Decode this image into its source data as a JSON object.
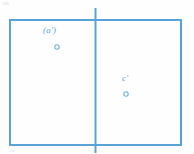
{
  "figure": {
    "colors": {
      "stroke": "#59a3d7",
      "stroke_light": "#7cbbe4",
      "label": "#5aa5d8",
      "background": "#fefefe",
      "marker_fill": "#ffffff"
    },
    "frame": {
      "name": "outer-rectangle",
      "x": 9,
      "y": 19,
      "width": 172,
      "height": 126,
      "stroke_width": 2
    },
    "divider": {
      "name": "vertical-divider",
      "x": 95,
      "y_top": 8,
      "y_bottom": 153,
      "stroke_width": 2
    },
    "points": [
      {
        "id": "a-prime",
        "label": "(a')",
        "cx": 57,
        "cy": 47,
        "r": 2.2,
        "label_x": 43,
        "label_y": 26
      },
      {
        "id": "c-prime",
        "label": "c'",
        "cx": 126,
        "cy": 94,
        "r": 2.2,
        "label_x": 122,
        "label_y": 74
      }
    ]
  }
}
